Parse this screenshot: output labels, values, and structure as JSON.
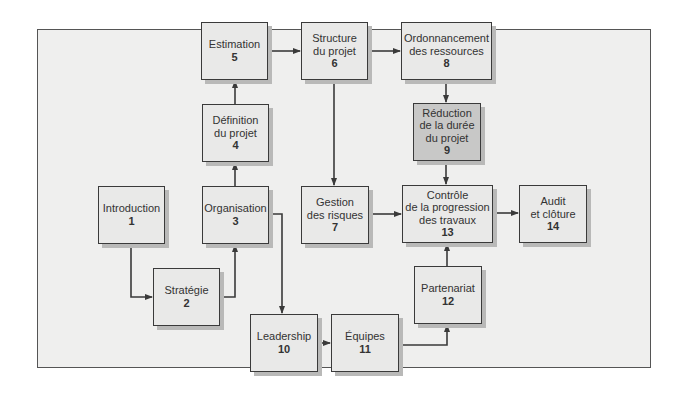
{
  "diagram": {
    "type": "flowchart",
    "colors": {
      "frame_bg": "#efefee",
      "box_bg": "#e9e9e8",
      "highlight_bg": "#c8c8c7",
      "line": "#3a3a3a",
      "shadow": "#b9b9b8"
    },
    "nodes": [
      {
        "id": 1,
        "label": "Introduction",
        "number": "1"
      },
      {
        "id": 2,
        "label": "Stratégie",
        "number": "2"
      },
      {
        "id": 3,
        "label": "Organisation",
        "number": "3"
      },
      {
        "id": 4,
        "label": "Définition\ndu projet",
        "number": "4"
      },
      {
        "id": 5,
        "label": "Estimation",
        "number": "5"
      },
      {
        "id": 6,
        "label": "Structure\ndu projet",
        "number": "6"
      },
      {
        "id": 7,
        "label": "Gestion\ndes risques",
        "number": "7"
      },
      {
        "id": 8,
        "label": "Ordonnancement\ndes ressources",
        "number": "8"
      },
      {
        "id": 9,
        "label": "Réduction\nde la durée\ndu projet",
        "number": "9",
        "highlighted": true
      },
      {
        "id": 10,
        "label": "Leadership",
        "number": "10"
      },
      {
        "id": 11,
        "label": "Équipes",
        "number": "11"
      },
      {
        "id": 12,
        "label": "Partenariat",
        "number": "12"
      },
      {
        "id": 13,
        "label": "Contrôle\nde la progression\ndes travaux",
        "number": "13"
      },
      {
        "id": 14,
        "label": "Audit\net clôture",
        "number": "14"
      }
    ],
    "edges": [
      {
        "from": 1,
        "to": 2
      },
      {
        "from": 2,
        "to": 3
      },
      {
        "from": 3,
        "to": 4
      },
      {
        "from": 4,
        "to": 5
      },
      {
        "from": 5,
        "to": 6
      },
      {
        "from": 6,
        "to": 8
      },
      {
        "from": 6,
        "to": 7
      },
      {
        "from": 8,
        "to": 9
      },
      {
        "from": 9,
        "to": 13
      },
      {
        "from": 7,
        "to": 13
      },
      {
        "from": 3,
        "to": 10
      },
      {
        "from": 10,
        "to": 11
      },
      {
        "from": 11,
        "to": 12
      },
      {
        "from": 12,
        "to": 13
      },
      {
        "from": 13,
        "to": 14
      }
    ]
  }
}
